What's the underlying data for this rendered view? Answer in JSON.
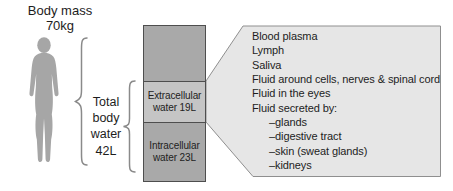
{
  "figure": {
    "body_mass": {
      "line1": "Body mass",
      "line2": "70kg"
    },
    "total_body_water": {
      "lines": [
        "Total",
        "body",
        "water",
        "42L"
      ]
    },
    "bar": {
      "extracellular_label": "Extracellular water 19L",
      "intracellular_label": "Intracellular water 23L"
    },
    "fluids": {
      "items": [
        {
          "text": "Blood plasma"
        },
        {
          "text": "Lymph"
        },
        {
          "text": "Saliva"
        },
        {
          "text": "Fluid around cells, nerves & spinal cord"
        },
        {
          "text": "Fluid in the eyes"
        },
        {
          "text": "Fluid secreted by:"
        },
        {
          "text": "–glands",
          "indent": true
        },
        {
          "text": "–digestive tract",
          "indent": true
        },
        {
          "text": "–skin (sweat glands)",
          "indent": true
        },
        {
          "text": "–kidneys",
          "indent": true
        }
      ]
    },
    "colors": {
      "background": "#ffffff",
      "person": "#a6a6a6",
      "bar_dark": "#a9a9a9",
      "bar_light": "#c5c5c5",
      "bar_border": "#4e4e4e",
      "callout_fill": "#e6e6e6",
      "callout_border": "#8f8f8f",
      "brace": "#8a8a8a",
      "text": "#1d1d1d"
    }
  }
}
